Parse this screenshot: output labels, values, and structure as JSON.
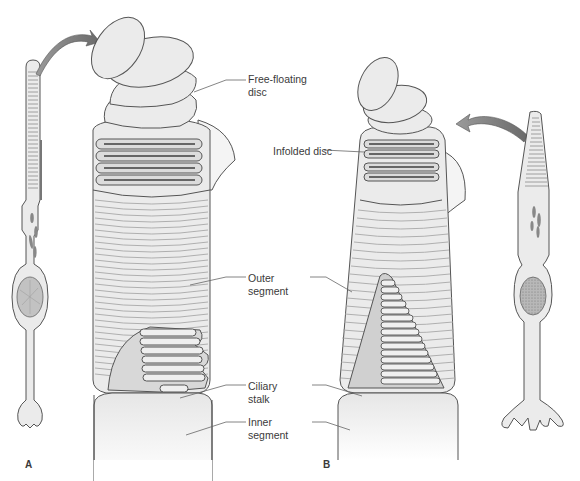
{
  "figure": {
    "panels": [
      {
        "id": "A",
        "label": "A",
        "cell_type": "rod"
      },
      {
        "id": "B",
        "label": "B",
        "cell_type": "cone"
      }
    ],
    "labels": {
      "free_floating_disc": "Free-floating\ndisc",
      "infolded_disc": "Infolded disc",
      "outer_segment": "Outer\nsegment",
      "ciliary_stalk": "Ciliary\nstalk",
      "inner_segment": "Inner\nsegment"
    },
    "colors": {
      "fill": "#ebebeb",
      "outline": "#555555",
      "disc_line": "#9a9a9a",
      "dark_fill": "#8a8a8a",
      "nucleus": "#b5b5b5",
      "text": "#3a3a3a"
    }
  }
}
